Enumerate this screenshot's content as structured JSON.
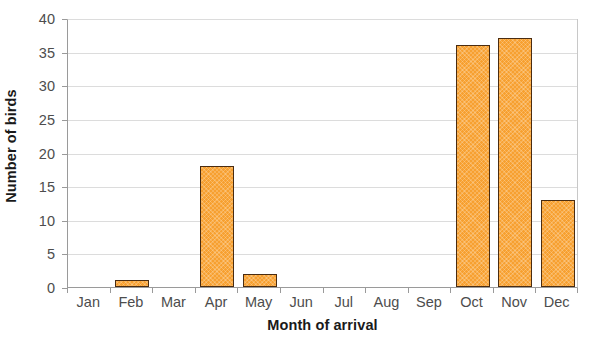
{
  "chart_data": {
    "type": "bar",
    "title": "",
    "xlabel": "Month of arrival",
    "ylabel": "Number of birds",
    "categories": [
      "Jan",
      "Feb",
      "Mar",
      "Apr",
      "May",
      "Jun",
      "Jul",
      "Aug",
      "Sep",
      "Oct",
      "Nov",
      "Dec"
    ],
    "values": [
      0,
      1,
      0,
      18,
      2,
      0,
      0,
      0,
      0,
      36,
      37,
      13
    ],
    "series": [
      {
        "name": "Number of birds",
        "values": [
          0,
          1,
          0,
          18,
          2,
          0,
          0,
          0,
          0,
          36,
          37,
          13
        ]
      }
    ],
    "ylim": [
      0,
      40
    ],
    "ytick_labels": [
      "0",
      "5",
      "10",
      "15",
      "20",
      "25",
      "30",
      "35",
      "40"
    ],
    "ytick_values": [
      0,
      5,
      10,
      15,
      20,
      25,
      30,
      35,
      40
    ],
    "ytick_step": 5,
    "grid": true,
    "grid_axis": "y",
    "legend": false,
    "legend_position": "none",
    "bar_fill_color": "#F7A030",
    "bar_border_color": "#4A2C11",
    "gridline_color": "#DCDCDC",
    "axis_color": "#9A9A9A",
    "tick_label_color": "#4D4D4D",
    "title_color": "#1A1A1A",
    "plot_background": "#FFFFFF"
  }
}
